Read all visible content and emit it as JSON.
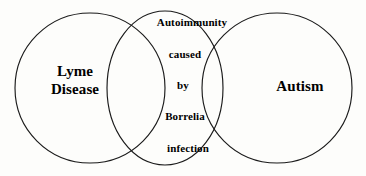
{
  "diagram": {
    "type": "venn",
    "title": "",
    "background_color": "#fdfdfb",
    "outline_color": "#1a1a1a",
    "text_color": "#000000",
    "sets": [
      {
        "id": "lyme",
        "label": "Lyme\nDisease",
        "label_line_1": "Lyme",
        "label_line_2": "Disease",
        "shape": "circle",
        "position": "left"
      },
      {
        "id": "middle",
        "label": "",
        "shape": "ellipse",
        "position": "center"
      },
      {
        "id": "autism",
        "label": "Autism",
        "shape": "circle",
        "position": "right"
      }
    ],
    "intersection": {
      "id": "center-overlap",
      "full_text": "Autoimmunity caused by Borrelia infection",
      "lines": [
        "Autoimmunity",
        "caused",
        "by",
        "Borrelia",
        "infection"
      ]
    }
  }
}
